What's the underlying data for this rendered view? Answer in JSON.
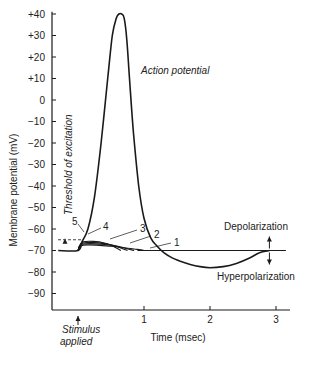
{
  "chart_data": {
    "type": "line",
    "title": "",
    "xlabel": "Time (msec)",
    "ylabel": "Membrane potential (mV)",
    "xlim": [
      -0.35,
      3.2
    ],
    "ylim": [
      -97,
      43
    ],
    "x_ticks": [
      {
        "value": 1,
        "label": "1"
      },
      {
        "value": 2,
        "label": "2"
      },
      {
        "value": 3,
        "label": "3"
      }
    ],
    "y_ticks": [
      {
        "value": 40,
        "label": "+40"
      },
      {
        "value": 30,
        "label": "+30"
      },
      {
        "value": 20,
        "label": "+20"
      },
      {
        "value": 10,
        "label": "+10"
      },
      {
        "value": 0,
        "label": "0"
      },
      {
        "value": -10,
        "label": "−10"
      },
      {
        "value": -20,
        "label": "−20"
      },
      {
        "value": -30,
        "label": "−30"
      },
      {
        "value": -40,
        "label": "−40"
      },
      {
        "value": -50,
        "label": "−50"
      },
      {
        "value": -60,
        "label": "−60"
      },
      {
        "value": -70,
        "label": "−70"
      },
      {
        "value": -80,
        "label": "−80"
      },
      {
        "value": -90,
        "label": "−90"
      }
    ],
    "resting_potential": -70,
    "threshold": -65,
    "series": [
      {
        "name": "Action potential",
        "x": [
          -0.3,
          0.0,
          0.06,
          0.15,
          0.25,
          0.35,
          0.45,
          0.52,
          0.58,
          0.62,
          0.66,
          0.7,
          0.74,
          0.78,
          0.84,
          0.92,
          1.0,
          1.1,
          1.2,
          1.3,
          1.4,
          1.55,
          1.7,
          1.85,
          2.0,
          2.2,
          2.4,
          2.6,
          2.75,
          2.9
        ],
        "y": [
          -70,
          -70,
          -66,
          -60,
          -45,
          -20,
          10,
          30,
          38,
          40,
          40,
          38,
          28,
          10,
          -15,
          -40,
          -55,
          -64,
          -68,
          -71,
          -73,
          -75,
          -76.5,
          -77.5,
          -78,
          -77.5,
          -76,
          -73.5,
          -71,
          -70
        ]
      },
      {
        "name": "1",
        "x": [
          0.0,
          0.08,
          0.5,
          0.9,
          1.0
        ],
        "y": [
          -70,
          -67.5,
          -68,
          -69.5,
          -70
        ]
      },
      {
        "name": "2",
        "x": [
          0.0,
          0.08,
          0.5,
          0.85
        ],
        "y": [
          -70,
          -67,
          -67.5,
          -70
        ]
      },
      {
        "name": "3",
        "x": [
          0.0,
          0.08,
          0.45,
          0.75
        ],
        "y": [
          -70,
          -66.5,
          -67,
          -70
        ]
      },
      {
        "name": "4",
        "x": [
          0.0,
          0.08,
          0.4,
          0.65
        ],
        "y": [
          -70,
          -66,
          -66.5,
          -70
        ]
      },
      {
        "name": "5",
        "x": [
          0.0,
          0.06
        ],
        "y": [
          -70,
          -66
        ]
      }
    ],
    "annotations": [
      {
        "text": "Action potential",
        "style": "italic"
      },
      {
        "text": "Threshold of excitation",
        "style": "italic",
        "rotated": true
      },
      {
        "text": "Depolarization",
        "style": "normal"
      },
      {
        "text": "Hyperpolarization",
        "style": "normal"
      },
      {
        "text": "Stimulus",
        "style": "italic"
      },
      {
        "text": "applied",
        "style": "italic"
      }
    ],
    "curve_labels": [
      "1",
      "2",
      "3",
      "4",
      "5"
    ],
    "grid": false,
    "legend": "none"
  }
}
